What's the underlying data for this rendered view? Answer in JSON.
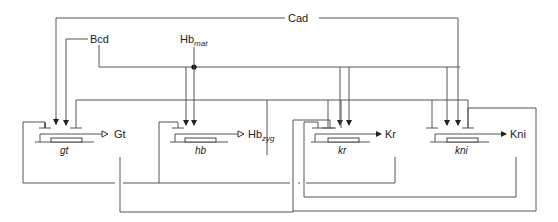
{
  "diagram": {
    "title": "",
    "type": "gene-regulatory-network",
    "regulators": {
      "cad": "Cad",
      "bcd": "Bcd",
      "hb_mat_base": "Hb",
      "hb_mat_sub": "mat"
    },
    "genes": [
      {
        "gene": "gt",
        "product": "Gt",
        "product_sub": ""
      },
      {
        "gene": "hb",
        "product": "Hb",
        "product_sub": "zyg"
      },
      {
        "gene": "kr",
        "product": "Kr",
        "product_sub": ""
      },
      {
        "gene": "kni",
        "product": "Kni",
        "product_sub": ""
      }
    ],
    "legend": {
      "activation": "arrow",
      "repression": "bar"
    },
    "colors": {
      "line": "#555555",
      "text": "#222222",
      "background": "#ffffff"
    }
  }
}
